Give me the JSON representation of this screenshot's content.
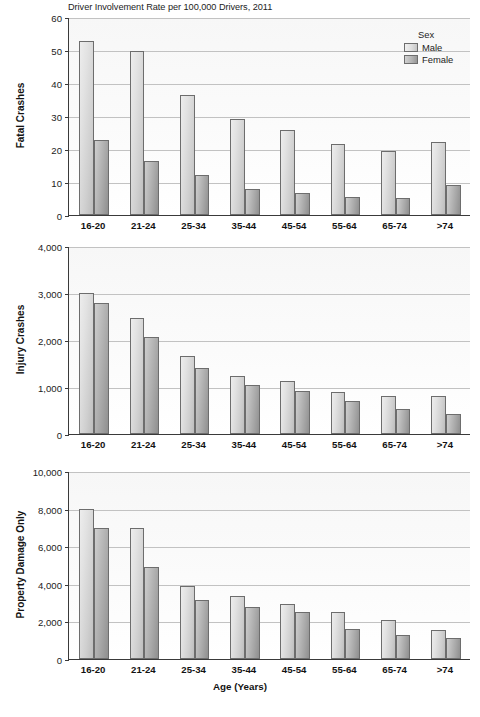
{
  "figure": {
    "title": "Driver Involvement Rate per 100,000 Drivers, 2011",
    "xaxis_title": "Age (Years)"
  },
  "legend": {
    "title": "Sex",
    "male_label": "Male",
    "female_label": "Female"
  },
  "panels": {
    "fatal": {
      "ylabel": "Fatal Crashes",
      "yticks": [
        "0",
        "10",
        "20",
        "30",
        "40",
        "50",
        "60"
      ]
    },
    "injury": {
      "ylabel": "Injury Crashes",
      "yticks": [
        "0",
        "1,000",
        "2,000",
        "3,000",
        "4,000"
      ]
    },
    "pdo": {
      "ylabel": "Property Damage Only",
      "yticks": [
        "0",
        "2,000",
        "4,000",
        "6,000",
        "8,000",
        "10,000"
      ]
    }
  },
  "xticks": [
    "16-20",
    "21-24",
    "25-34",
    "35-44",
    "45-54",
    "55-64",
    "65-74",
    ">74"
  ],
  "colors": {
    "male": "#dcdcdc",
    "female": "#a8a8a8",
    "axis": "#3a3a3a",
    "grid": "#c2c2c2"
  },
  "chart_data": [
    {
      "type": "bar",
      "title": "Driver Involvement Rate per 100,000 Drivers, 2011",
      "panel": "Fatal Crashes",
      "xlabel": "Age (Years)",
      "ylabel": "Fatal Crashes",
      "ylim": [
        0,
        60
      ],
      "ytick_values": [
        0,
        10,
        20,
        30,
        40,
        50,
        60
      ],
      "grid": true,
      "legend_position": "top-right",
      "categories": [
        "16-20",
        "21-24",
        "25-34",
        "35-44",
        "45-54",
        "55-64",
        "65-74",
        ">74"
      ],
      "series": [
        {
          "name": "Male",
          "values": [
            52.8,
            49.6,
            36.4,
            29.2,
            25.9,
            21.6,
            19.4,
            22.1
          ]
        },
        {
          "name": "Female",
          "values": [
            22.7,
            16.5,
            12.2,
            8.0,
            6.8,
            5.6,
            5.3,
            9.1
          ]
        }
      ]
    },
    {
      "type": "bar",
      "panel": "Injury Crashes",
      "xlabel": "Age (Years)",
      "ylabel": "Injury Crashes",
      "ylim": [
        0,
        4000
      ],
      "ytick_values": [
        0,
        1000,
        2000,
        3000,
        4000
      ],
      "grid": true,
      "categories": [
        "16-20",
        "21-24",
        "25-34",
        "35-44",
        "45-54",
        "55-64",
        "65-74",
        ">74"
      ],
      "series": [
        {
          "name": "Male",
          "values": [
            2990,
            2470,
            1660,
            1230,
            1130,
            890,
            800,
            810
          ]
        },
        {
          "name": "Female",
          "values": [
            2780,
            2070,
            1400,
            1040,
            920,
            710,
            540,
            430
          ]
        }
      ]
    },
    {
      "type": "bar",
      "panel": "Property Damage Only",
      "xlabel": "Age (Years)",
      "ylabel": "Property Damage Only",
      "ylim": [
        0,
        10000
      ],
      "ytick_values": [
        0,
        2000,
        4000,
        6000,
        8000,
        10000
      ],
      "grid": true,
      "categories": [
        "16-20",
        "21-24",
        "25-34",
        "35-44",
        "45-54",
        "55-64",
        "65-74",
        ">74"
      ],
      "series": [
        {
          "name": "Male",
          "values": [
            7980,
            6950,
            3900,
            3370,
            2930,
            2490,
            2080,
            1530
          ]
        },
        {
          "name": "Female",
          "values": [
            6980,
            4910,
            3130,
            2750,
            2520,
            1600,
            1260,
            1120
          ]
        }
      ]
    }
  ]
}
